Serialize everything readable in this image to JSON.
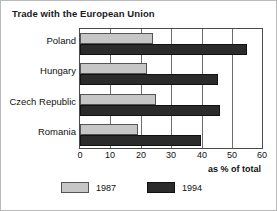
{
  "chart_data": {
    "type": "bar",
    "orientation": "horizontal",
    "title": "Trade with the European Union",
    "xlabel": "as % of total",
    "ylabel": "",
    "categories": [
      "Poland",
      "Hungary",
      "Czech Republic",
      "Romania"
    ],
    "series": [
      {
        "name": "1987",
        "color": "#c6c6c6",
        "values": [
          24,
          22,
          25,
          19
        ]
      },
      {
        "name": "1994",
        "color": "#2b2b2b",
        "values": [
          55,
          45.5,
          46,
          40
        ]
      }
    ],
    "xlim": [
      0,
      60
    ],
    "xticks": [
      0,
      10,
      20,
      30,
      40,
      50,
      60
    ],
    "xtick_labels": [
      "0",
      "10",
      "20",
      "30",
      "40",
      "50",
      "60"
    ],
    "grid": "vertical",
    "legend_position": "bottom"
  },
  "legend": {
    "items": [
      {
        "label": "1987"
      },
      {
        "label": "1994"
      }
    ]
  }
}
